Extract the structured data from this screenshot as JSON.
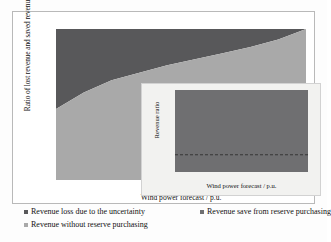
{
  "chart_data": [
    {
      "id": "main",
      "type": "area",
      "title": "",
      "xlabel": "Wind power forecast / p.u.",
      "ylabel": "Ratio of lost revenue and saved revenue",
      "xlim": [
        0.05,
        0.95
      ],
      "ylim": [
        0,
        100
      ],
      "grid": false,
      "stacked": true,
      "stack_total_percent": 100,
      "legend_position": "below",
      "x": [
        0.05,
        0.15,
        0.25,
        0.35,
        0.45,
        0.55,
        0.65,
        0.75,
        0.85,
        0.95
      ],
      "xtick_labels": [
        "0.05",
        "0.15",
        "0.25",
        "0.35",
        "0.45",
        "0.55",
        "0.65",
        "0.75",
        "0.85",
        "0.95"
      ],
      "ytick_labels": [
        "0%",
        "10%",
        "20%",
        "30%",
        "40%",
        "50%",
        "60%",
        "70%",
        "80%",
        "90%",
        "100%"
      ],
      "series": [
        {
          "name": "Revenue without reserve purchasing",
          "color": "#a9a9a9",
          "values": [
            47,
            58,
            66,
            71,
            76,
            80,
            84,
            88,
            93,
            100
          ]
        },
        {
          "name": "Revenue loss due to the uncertainty",
          "color": "#58585a",
          "values": [
            53,
            42,
            34,
            29,
            24,
            20,
            16,
            12,
            7,
            0
          ]
        }
      ]
    },
    {
      "id": "inset",
      "type": "area",
      "title": "",
      "xlabel": "Wind power forecast / p.u.",
      "ylabel": "Revenue ratio",
      "xlim": [
        0.05,
        0.95
      ],
      "ylim": [
        0,
        100
      ],
      "grid": false,
      "x": [
        0.05,
        0.15,
        0.25,
        0.35,
        0.45,
        0.55,
        0.65,
        0.75,
        0.85,
        0.95
      ],
      "xtick_labels": [
        "0.05",
        "0.15",
        "0.25",
        "0.35",
        "0.45",
        "0.55",
        "0.65",
        "0.75",
        "0.85",
        "0.95"
      ],
      "ytick_labels": [
        "0%",
        "10%",
        "20%",
        "30%",
        "40%",
        "50%",
        "60%",
        "70%",
        "80%",
        "90%",
        "100%"
      ],
      "series": [
        {
          "name": "Revenue ratio band",
          "color": "#6f6f71",
          "values": [
            100,
            100,
            100,
            100,
            100,
            100,
            100,
            100,
            100,
            100
          ]
        },
        {
          "name": "Reserve purchasing threshold",
          "style": "dashed",
          "color": "#2e2e2e",
          "values": [
            21,
            21,
            21,
            21,
            21,
            21,
            21,
            21,
            21,
            21
          ]
        }
      ]
    }
  ],
  "main_chart": {
    "y_axis_title": "Ratio of lost revenue and saved revenue",
    "x_axis_title": "Wind power forecast / p.u.",
    "y_ticks": [
      "100%",
      "90%",
      "80%",
      "70%",
      "60%",
      "50%",
      "40%",
      "30%",
      "20%",
      "10%",
      "0%"
    ],
    "x_ticks": [
      "0.05",
      "0.15",
      "0.25",
      "0.35",
      "0.45",
      "0.55",
      "0.65",
      "0.75",
      "0.85",
      "0.95"
    ]
  },
  "inset_chart": {
    "y_axis_title": "Revenue ratio",
    "x_axis_title": "Wind power forecast / p.u.",
    "y_ticks": [
      "100%",
      "90%",
      "80%",
      "70%",
      "60%",
      "50%",
      "40%",
      "30%",
      "20%",
      "10%",
      "0%"
    ],
    "x_ticks": [
      "0.05",
      "0.15",
      "0.25",
      "0.35",
      "0.45",
      "0.55",
      "0.65",
      "0.75",
      "0.85",
      "0.95"
    ]
  },
  "legend": {
    "items": [
      {
        "label": "Revenue loss due to the uncertainty",
        "color": "#58585a"
      },
      {
        "label": "Revenue save from reserve purchasing",
        "color": "#6f6f71"
      },
      {
        "label": "Revenue without reserve purchasing",
        "color": "#a9a9a9"
      }
    ]
  },
  "colors": {
    "loss_dark": "#58585a",
    "save_mid": "#6f6f71",
    "without_light": "#a9a9a9",
    "frame": "#b9b9b9",
    "inset_background": "#f2f2f0"
  }
}
